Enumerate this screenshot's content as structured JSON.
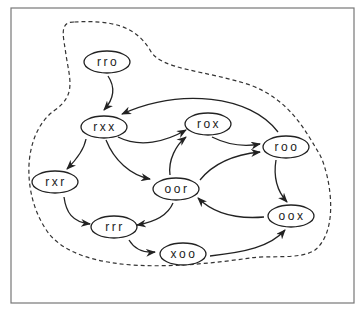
{
  "diagram": {
    "type": "state-transition-graph",
    "frame": {
      "x": 11,
      "y": 8,
      "width": 343,
      "height": 295,
      "stroke": "#777777"
    },
    "region": {
      "style": "dashed",
      "path": "M 74 22 C 58 22 64 38 66 55 C 70 80 76 95 55 110 C 20 135 22 200 50 235 C 85 275 180 268 250 258 C 270 255 300 260 315 250 C 340 230 330 175 320 155 C 305 130 290 100 250 85 C 205 70 160 70 150 50 C 135 25 110 20 74 22 Z"
    },
    "nodes": [
      {
        "id": "rro",
        "label": "rro",
        "cx": 107,
        "cy": 62
      },
      {
        "id": "rxx",
        "label": "rxx",
        "cx": 104,
        "cy": 127
      },
      {
        "id": "rox",
        "label": "rox",
        "cx": 208,
        "cy": 124
      },
      {
        "id": "roo",
        "label": "roo",
        "cx": 286,
        "cy": 147
      },
      {
        "id": "rxr",
        "label": "rxr",
        "cx": 55,
        "cy": 182
      },
      {
        "id": "oor",
        "label": "oor",
        "cx": 176,
        "cy": 189
      },
      {
        "id": "rrr",
        "label": "rrr",
        "cx": 114,
        "cy": 227
      },
      {
        "id": "oox",
        "label": "oox",
        "cx": 291,
        "cy": 216
      },
      {
        "id": "xoo",
        "label": "xoo",
        "cx": 183,
        "cy": 254
      }
    ],
    "edges": [
      {
        "from": "rro",
        "to": "rxx",
        "path": "M 108 76 C 116 88 113 100 104 110"
      },
      {
        "from": "roo",
        "to": "rxx",
        "path": "M 278 132 C 250 95 180 88 122 114"
      },
      {
        "from": "rxx",
        "to": "rox",
        "path": "M 118 137 C 140 148 165 142 186 130"
      },
      {
        "from": "rxx",
        "to": "rxr",
        "path": "M 86 139 C 84 150 76 160 67 169"
      },
      {
        "from": "rxx",
        "to": "oor",
        "path": "M 106 140 C 114 160 130 175 150 179"
      },
      {
        "from": "rox",
        "to": "roo",
        "path": "M 212 137 C 228 145 244 147 260 144"
      },
      {
        "from": "oor",
        "to": "rox",
        "path": "M 170 175 C 168 160 176 145 186 137"
      },
      {
        "from": "oor",
        "to": "roo",
        "path": "M 200 180 C 212 165 230 155 260 152"
      },
      {
        "from": "roo",
        "to": "oox",
        "path": "M 276 160 C 273 178 278 192 287 202"
      },
      {
        "from": "oox",
        "to": "oor",
        "path": "M 264 217 C 240 219 215 215 198 198"
      },
      {
        "from": "oor",
        "to": "rrr",
        "path": "M 173 203 C 168 215 155 222 137 225"
      },
      {
        "from": "rxr",
        "to": "rrr",
        "path": "M 64 197 C 66 212 72 222 90 224"
      },
      {
        "from": "rrr",
        "to": "xoo",
        "path": "M 129 240 C 135 250 144 253 155 252"
      },
      {
        "from": "xoo",
        "to": "oox",
        "path": "M 210 256 C 245 252 270 247 285 230"
      }
    ],
    "colors": {
      "node_stroke": "#222222",
      "edge": "#222222",
      "region": "#333333",
      "background": "#ffffff"
    }
  }
}
